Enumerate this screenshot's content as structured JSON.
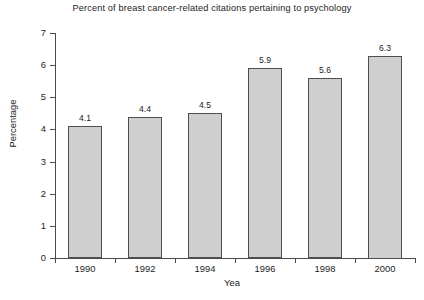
{
  "chart_data": {
    "type": "bar",
    "title": "Percent of breast cancer-related citations pertaining to psychology",
    "xlabel": "Yea",
    "ylabel": "Percentage",
    "categories": [
      "1990",
      "1992",
      "1994",
      "1996",
      "1998",
      "2000"
    ],
    "values": [
      4.1,
      4.4,
      4.5,
      5.9,
      5.6,
      6.3
    ],
    "value_labels": [
      "4.1",
      "4.4",
      "4.5",
      "5.9",
      "5.6",
      "6.3"
    ],
    "ylim": [
      0,
      7
    ],
    "ytick_labels": [
      "0",
      "1",
      "2",
      "3",
      "4",
      "5",
      "6",
      "7"
    ],
    "ytick_values": [
      0,
      1,
      2,
      3,
      4,
      5,
      6,
      7
    ],
    "grid": false,
    "legend": false,
    "bar_fill_color": "#cfcfcf",
    "bar_edge_color": "#4f4f4f",
    "axis_color": "#4a4a4a",
    "background_color": "#ffffff",
    "text_color": "#1d1d1d"
  }
}
